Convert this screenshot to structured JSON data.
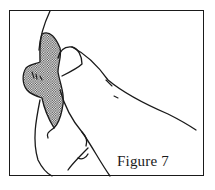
{
  "figure": {
    "caption": "Figure 7",
    "colors": {
      "line": "#1a1a1a",
      "background": "#ffffff"
    }
  }
}
